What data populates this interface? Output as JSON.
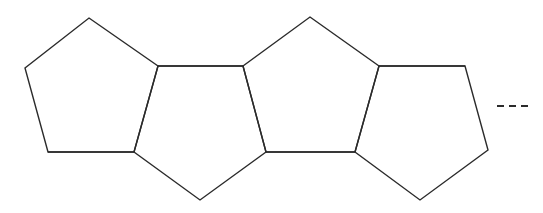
{
  "figure": {
    "background_color": "#ffffff",
    "stroke_color": "#2b2b2b",
    "stroke_width": 1.4,
    "canvas": {
      "width": 543,
      "height": 213
    }
  },
  "structure": {
    "type": "polygon-chain",
    "polygon_sides": 5,
    "ring_count": 3,
    "fusion": "edge-fused",
    "continues": true
  },
  "rings": [
    {
      "name": "left-pentagon",
      "label": "Ring 1",
      "orientation": "apex-up",
      "points": "89,18 158,66 134,152 48,152 25,68"
    },
    {
      "name": "middle-upper-pentagon",
      "label": "Ring 2",
      "orientation": "apex-up",
      "points": "310,17 379,66 355,152 266,152 243,66"
    },
    {
      "name": "middle-lower-pentagon",
      "label": "Ring 3",
      "orientation": "apex-down",
      "points": "158,66 243,66 266,152 200,200 134,152"
    },
    {
      "name": "right-pentagon",
      "label": "Ring 4",
      "orientation": "apex-down",
      "points": "379,66 465,66 488,150 420,200 355,152"
    }
  ],
  "fusion_bonds": [
    {
      "name": "fusion-bond-top-left",
      "x1": 158,
      "y1": 66,
      "x2": 243,
      "y2": 66
    },
    {
      "name": "fusion-bond-bottom-left",
      "x1": 48,
      "y1": 152,
      "x2": 134,
      "y2": 152
    },
    {
      "name": "fusion-bond-top-right",
      "x1": 379,
      "y1": 66,
      "x2": 465,
      "y2": 66
    },
    {
      "name": "fusion-bond-bottom-right",
      "x1": 266,
      "y1": 152,
      "x2": 355,
      "y2": 152
    }
  ],
  "continuation": {
    "name": "dashed-continuation",
    "meaning": "chain continues",
    "dash_count": 3,
    "x1": 497,
    "y1": 106,
    "x2": 529,
    "y2": 106,
    "dash_pattern": "7 5"
  },
  "labels": {
    "caption": ""
  }
}
